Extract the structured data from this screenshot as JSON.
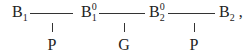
{
  "diagram": {
    "nodes": [
      {
        "id": "B1",
        "base": "B",
        "sub": "1",
        "sup": ""
      },
      {
        "id": "B1_0",
        "base": "B",
        "sub": "1",
        "sup": "0"
      },
      {
        "id": "B2_0",
        "base": "B",
        "sub": "2",
        "sup": "0"
      },
      {
        "id": "B2",
        "base": "B",
        "sub": "2",
        "sup": "",
        "trailing": ","
      }
    ],
    "edges": [
      {
        "from": "B1",
        "to": "B1_0",
        "label": "P"
      },
      {
        "from": "B1_0",
        "to": "B2_0",
        "label": "G"
      },
      {
        "from": "B2_0",
        "to": "B2",
        "label": "P"
      }
    ]
  }
}
